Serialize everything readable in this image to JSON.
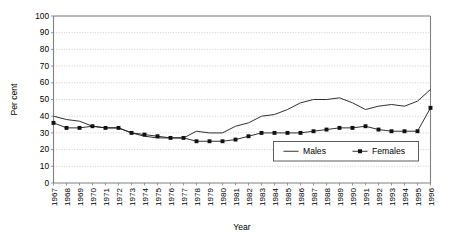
{
  "chart_data": {
    "type": "line",
    "title": "",
    "xlabel": "Year",
    "ylabel": "Per cent",
    "ylim": [
      0,
      100
    ],
    "ytick_step": 10,
    "yticks": [
      0,
      10,
      20,
      30,
      40,
      50,
      60,
      70,
      80,
      90,
      100
    ],
    "grid": "horizontal-dotted",
    "legend_position": "inside-bottom-right",
    "categories": [
      "1967",
      "1968",
      "1969",
      "1970",
      "1971",
      "1972",
      "1973",
      "1974",
      "1975",
      "1976",
      "1977",
      "1978",
      "1979",
      "1980",
      "1981",
      "1982",
      "1983",
      "1984",
      "1985",
      "1986",
      "1987",
      "1988",
      "1989",
      "1990",
      "1991",
      "1992",
      "1993",
      "1994",
      "1995",
      "1996"
    ],
    "series": [
      {
        "name": "Males",
        "marker": "diamond",
        "color": "#111111",
        "values": [
          40,
          38,
          37,
          34,
          33,
          33,
          30,
          28,
          27,
          27,
          27,
          31,
          30,
          30,
          34,
          36,
          40,
          41,
          44,
          48,
          50,
          50,
          51,
          48,
          44,
          46,
          47,
          46,
          49,
          52
        ],
        "final_value": 56
      },
      {
        "name": "Females",
        "marker": "square",
        "color": "#111111",
        "values": [
          36,
          33,
          33,
          34,
          33,
          33,
          30,
          29,
          28,
          27,
          27,
          25,
          25,
          25,
          26,
          28,
          30,
          30,
          30,
          30,
          31,
          32,
          33,
          33,
          34,
          32,
          31,
          31,
          31,
          33
        ],
        "final_value": 45
      }
    ]
  },
  "legend": {
    "entries": [
      {
        "label": "Males",
        "marker": "diamond"
      },
      {
        "label": "Females",
        "marker": "square"
      }
    ]
  },
  "axes": {
    "y_title": "Per cent",
    "x_title": "Year"
  }
}
